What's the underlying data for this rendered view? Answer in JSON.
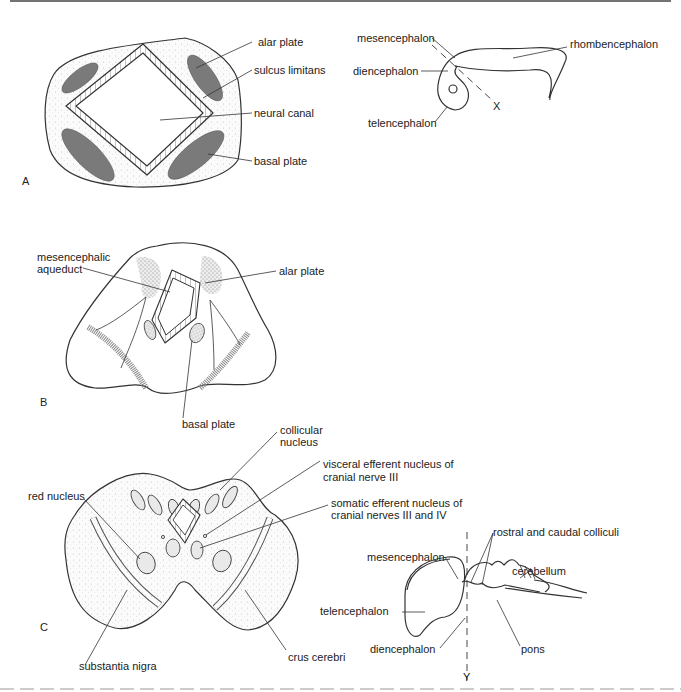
{
  "figure": {
    "panels": {
      "A": {
        "letter": "A",
        "labels": {
          "alar_plate": "alar plate",
          "sulcus_limitans": "sulcus limitans",
          "neural_canal": "neural canal",
          "basal_plate": "basal plate"
        },
        "inset": {
          "mesencephalon": "mesencephalon",
          "diencephalon": "diencephalon",
          "telencephalon": "telencephalon",
          "rhombencephalon": "rhombencephalon",
          "section_marker": "X"
        }
      },
      "B": {
        "letter": "B",
        "labels": {
          "mesencephalic_aqueduct_1": "mesencephalic",
          "mesencephalic_aqueduct_2": "aqueduct",
          "alar_plate": "alar plate",
          "basal_plate": "basal plate"
        }
      },
      "C": {
        "letter": "C",
        "labels": {
          "collicular_nucleus_1": "collicular",
          "collicular_nucleus_2": "nucleus",
          "visceral_efferent_1": "visceral efferent nucleus of",
          "visceral_efferent_2": "cranial nerve III",
          "somatic_efferent_1": "somatic efferent nucleus of",
          "somatic_efferent_2": "cranial nerves III and IV",
          "red_nucleus": "red nucleus",
          "substantia_nigra": "substantia nigra",
          "crus_cerebri": "crus cerebri"
        },
        "inset": {
          "rostral_caudal_colliculi": "rostral and caudal colliculi",
          "mesencephalon": "mesencephalon",
          "cerebellum": "cerebellum",
          "telencephalon": "telencephalon",
          "diencephalon": "diencephalon",
          "pons": "pons",
          "section_marker": "Y"
        }
      }
    }
  }
}
